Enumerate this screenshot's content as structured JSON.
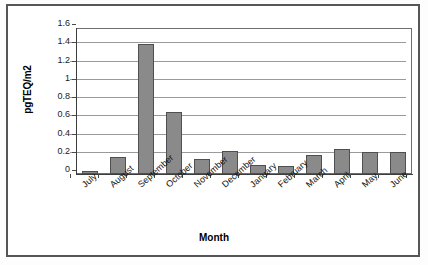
{
  "chart_data": {
    "type": "bar",
    "title": "",
    "xlabel": "Month",
    "ylabel": "pgTEQ/m2",
    "categories": [
      "July",
      "August",
      "September",
      "October",
      "November",
      "December",
      "January",
      "February",
      "March",
      "April",
      "May",
      "June"
    ],
    "values": [
      0.03,
      0.19,
      1.43,
      0.68,
      0.165,
      0.25,
      0.1,
      0.09,
      0.21,
      0.27,
      0.245,
      0.24
    ],
    "ylim": [
      0,
      1.6
    ],
    "ytick_values": [
      0,
      0.2,
      0.4,
      0.6,
      0.8,
      1.0,
      1.2,
      1.4,
      1.6
    ],
    "ytick_labels": [
      "0",
      "0.2",
      "0.4",
      "0.6",
      "0.8",
      "1",
      "1.2",
      "1.4",
      "1.6"
    ],
    "grid": true,
    "legend": false,
    "legend_position": "none",
    "bar_color": "#8a8a8a",
    "bar_edge_color": "#4f4f4f",
    "gridline_color": "#9a9a9a",
    "axis_color": "#3d3d3d",
    "background_color": "#ffffff",
    "xtick_label_rotation": -42
  }
}
